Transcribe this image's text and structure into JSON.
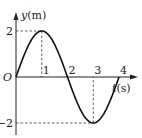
{
  "chart_data": {
    "type": "line",
    "title": "",
    "xlabel": "t(s)",
    "ylabel": "y(m)",
    "x_var": "t",
    "x_unit": "(s)",
    "y_var": "y",
    "y_unit": "(m)",
    "origin_label": "O",
    "xlim": [
      0,
      4
    ],
    "ylim": [
      -2,
      2
    ],
    "x_ticks": [
      "1",
      "2",
      "3",
      "4"
    ],
    "y_ticks": [
      "2",
      "-2"
    ],
    "grid": false,
    "legend": "none",
    "series": [
      {
        "name": "y(t) = 2 sin(πt/2)",
        "amplitude": 2,
        "period": 4,
        "x": [
          0,
          0.5,
          1,
          1.5,
          2,
          2.5,
          3,
          3.5,
          4
        ],
        "values": [
          0,
          1.414,
          2,
          1.414,
          0,
          -1.414,
          -2,
          -1.414,
          0
        ]
      }
    ],
    "annotations": [
      {
        "type": "dashed-guide",
        "point": [
          1,
          2
        ]
      },
      {
        "type": "dashed-guide",
        "point": [
          3,
          -2
        ]
      }
    ]
  }
}
